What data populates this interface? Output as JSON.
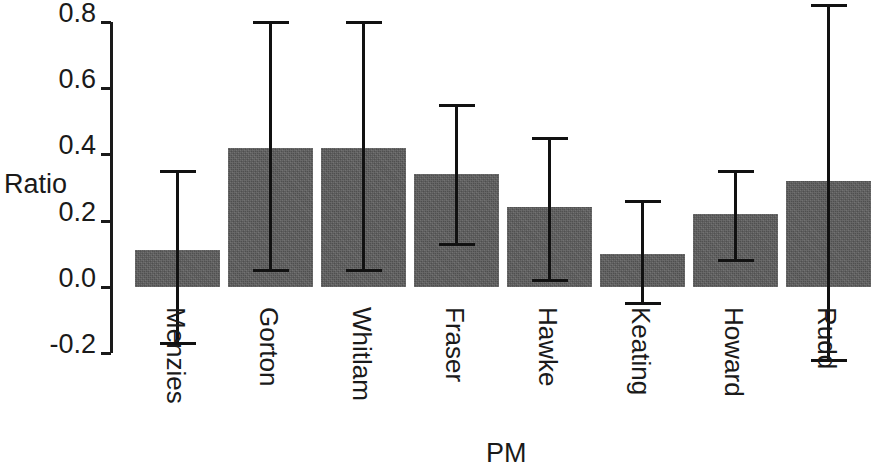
{
  "chart_data": {
    "type": "bar",
    "title": "",
    "xlabel": "PM",
    "ylabel": "Ratio",
    "categories": [
      "Menzies",
      "Gorton",
      "Whitlam",
      "Fraser",
      "Hawke",
      "Keating",
      "Howard",
      "Rudd"
    ],
    "values": [
      0.11,
      0.42,
      0.42,
      0.34,
      0.24,
      0.1,
      0.22,
      0.32
    ],
    "error_low": [
      -0.17,
      0.05,
      0.05,
      0.13,
      0.02,
      -0.05,
      0.08,
      -0.22
    ],
    "error_high": [
      0.35,
      0.8,
      0.8,
      0.55,
      0.45,
      0.26,
      0.35,
      0.85
    ],
    "ylim": [
      -0.2,
      0.8
    ],
    "xlim": [
      0,
      8
    ],
    "yticks": [
      -0.2,
      0.0,
      0.2,
      0.4,
      0.6,
      0.8
    ],
    "ytick_labels": [
      "-0.2",
      "0.0",
      "0.2",
      "0.4",
      "0.6",
      "0.8"
    ],
    "grid": false,
    "legend": false,
    "legend_position": "none",
    "bar_color": "#5d5d5d",
    "error_color": "#111111",
    "axis_color": "#1a1a1a",
    "note": "Error bars shown as vertical whiskers with horizontal caps; last bar (Rudd) is clipped at the right edge of the figure."
  },
  "axes": {
    "y_title": "Ratio",
    "x_title": "PM"
  }
}
